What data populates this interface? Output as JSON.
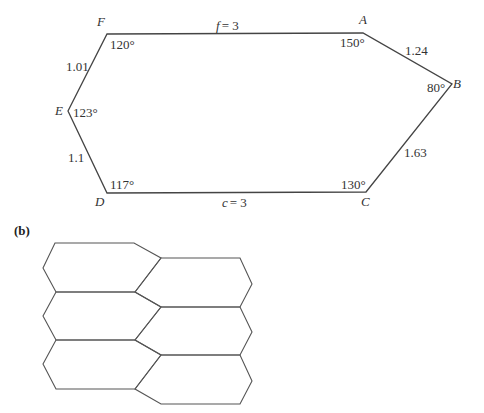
{
  "figure": {
    "part_b_label": "(b)",
    "hexagon": {
      "vertices": {
        "A": "A",
        "B": "B",
        "C": "C",
        "D": "D",
        "E": "E",
        "F": "F"
      },
      "angles": {
        "A": "150°",
        "B": "80°",
        "C": "130°",
        "D": "117°",
        "E": "123°",
        "F": "120°"
      },
      "sides": {
        "FA": "f = 3",
        "AB": "1.24",
        "BC": "1.63",
        "CD": "c = 3",
        "DE": "1.1",
        "EF": "1.01"
      }
    },
    "tiling": {
      "description": "Tiling of the plane by copies of the convex hexagon, two columns, three rows",
      "tile_count": 6
    }
  }
}
